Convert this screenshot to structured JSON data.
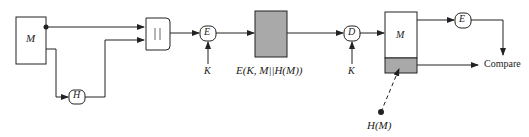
{
  "diagram": {
    "sender_message": "M",
    "hash_function": "H",
    "concat_symbol": "||",
    "encrypt_label": "E",
    "key_label_1": "K",
    "ciphertext_label": "E(K, M||H(M))",
    "decrypt_label": "D",
    "key_label_2": "K",
    "receiver_message": "M",
    "receiver_hash_label": "E",
    "compare_label": "Compare",
    "received_hash_label": "H(M)"
  },
  "colors": {
    "line": "#222222",
    "gray_fill": "#a9a9a9"
  }
}
